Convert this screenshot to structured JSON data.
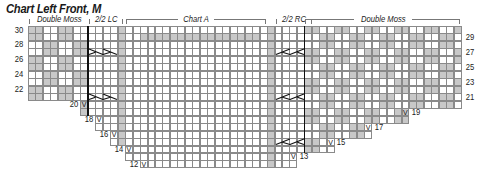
{
  "title": "Chart Left Front, M",
  "sections": [
    {
      "label": "Double Moss",
      "start_col": 0,
      "cols": 8
    },
    {
      "label": "2/2 LC",
      "start_col": 8,
      "cols": 4
    },
    {
      "label": "Chart A",
      "start_col": 13,
      "cols": 19
    },
    {
      "label": "2/2 RC",
      "start_col": 33,
      "cols": 4
    },
    {
      "label": "Double Moss",
      "start_col": 37,
      "cols": 21
    }
  ],
  "grid": {
    "origin_x": 28,
    "origin_y": 26,
    "cell_w": 7.47,
    "cell_h": 7.47,
    "total_cols": 58,
    "top_row": 30,
    "bottom_row": 12,
    "purl_cols": [
      12,
      32
    ],
    "thick_lines_after_col": [
      7,
      36
    ],
    "chart_a_gray_row": {
      "row": 29,
      "from_col": 15,
      "to_col": 30
    },
    "moss_gray": "#c8c8c8",
    "line_color": "#8a8a8a"
  },
  "row_extents": [
    {
      "row": 30,
      "from": 0,
      "to": 57
    },
    {
      "row": 29,
      "from": 0,
      "to": 57
    },
    {
      "row": 28,
      "from": 0,
      "to": 57
    },
    {
      "row": 27,
      "from": 0,
      "to": 57
    },
    {
      "row": 26,
      "from": 0,
      "to": 57
    },
    {
      "row": 25,
      "from": 0,
      "to": 57
    },
    {
      "row": 24,
      "from": 0,
      "to": 57
    },
    {
      "row": 23,
      "from": 0,
      "to": 57
    },
    {
      "row": 22,
      "from": 0,
      "to": 57
    },
    {
      "row": 21,
      "from": 0,
      "to": 57
    },
    {
      "row": 20,
      "from": 7,
      "to": 57
    },
    {
      "row": 19,
      "from": 7,
      "to": 50
    },
    {
      "row": 18,
      "from": 9,
      "to": 50
    },
    {
      "row": 17,
      "from": 9,
      "to": 45
    },
    {
      "row": 16,
      "from": 11,
      "to": 45
    },
    {
      "row": 15,
      "from": 11,
      "to": 40
    },
    {
      "row": 14,
      "from": 13,
      "to": 40
    },
    {
      "row": 13,
      "from": 13,
      "to": 35
    },
    {
      "row": 12,
      "from": 15,
      "to": 35
    }
  ],
  "cables": [
    {
      "type": "LC",
      "row": 27,
      "start_col": 8
    },
    {
      "type": "LC",
      "row": 21,
      "start_col": 8
    },
    {
      "type": "RC",
      "row": 27,
      "start_col": 33
    },
    {
      "type": "RC",
      "row": 21,
      "start_col": 33
    },
    {
      "type": "RC",
      "row": 15,
      "start_col": 33
    }
  ],
  "left_row_labels": [
    "30",
    "28",
    "26",
    "24",
    "22"
  ],
  "right_row_labels": [
    "29",
    "27",
    "25",
    "23",
    "21"
  ],
  "step_labels_left": [
    {
      "row": 20,
      "text": "20"
    },
    {
      "row": 18,
      "text": "18"
    },
    {
      "row": 16,
      "text": "16"
    },
    {
      "row": 14,
      "text": "14"
    },
    {
      "row": 12,
      "text": "12"
    }
  ],
  "step_labels_right": [
    {
      "row": 19,
      "text": "19"
    },
    {
      "row": 17,
      "text": "17"
    },
    {
      "row": 15,
      "text": "15"
    },
    {
      "row": 13,
      "text": "13"
    }
  ],
  "increase_symbol": "V"
}
